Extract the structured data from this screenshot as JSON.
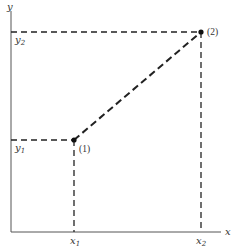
{
  "diagram": {
    "axes": {
      "x_label": "x",
      "y_label": "y",
      "color": "#555555"
    },
    "points": [
      {
        "id": "1",
        "label": "(1)",
        "x_label": "x",
        "x_sub": "1",
        "y_label": "y",
        "y_sub": "1"
      },
      {
        "id": "2",
        "label": "(2)",
        "x_label": "x",
        "x_sub": "2",
        "y_label": "y",
        "y_sub": "2"
      }
    ],
    "line_style": "dashed",
    "line_color": "#222222"
  }
}
